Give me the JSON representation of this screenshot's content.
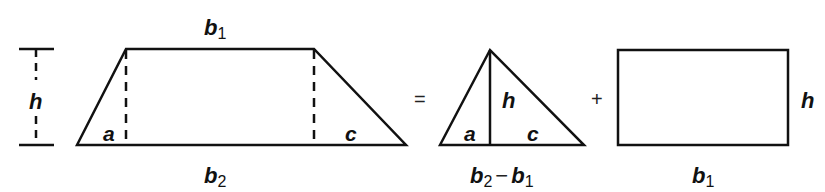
{
  "diagram": {
    "colors": {
      "stroke": "#111111",
      "background": "#ffffff"
    },
    "trapezoid": {
      "top_label": {
        "var": "b",
        "sub": "1"
      },
      "bottom_label": {
        "var": "b",
        "sub": "2"
      },
      "height_label": "h",
      "left_segment_label": "a",
      "right_segment_label": "c"
    },
    "operators": {
      "equals": "=",
      "plus": "+"
    },
    "triangle": {
      "height_label": "h",
      "left_segment_label": "a",
      "right_segment_label": "c",
      "base_label": {
        "var1": "b",
        "sub1": "2",
        "minus": "−",
        "var2": "b",
        "sub2": "1"
      }
    },
    "rectangle": {
      "height_label": "h",
      "base_label": {
        "var": "b",
        "sub": "1"
      }
    }
  }
}
